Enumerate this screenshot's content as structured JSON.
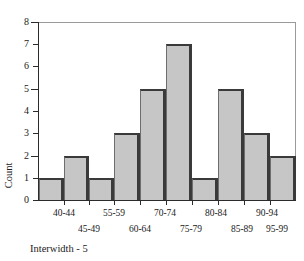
{
  "chart_data": {
    "type": "bar",
    "title": "",
    "xlabel": "Interwidth - 5",
    "ylabel": "Count",
    "ylim": [
      0,
      8
    ],
    "yticks": [
      0,
      1,
      2,
      3,
      4,
      5,
      6,
      7,
      8
    ],
    "grid": false,
    "legend": null,
    "categories": [
      "40-44",
      "45-49",
      "50-54",
      "55-59",
      "60-64",
      "65-69",
      "70-74",
      "75-79",
      "80-84",
      "85-89",
      "90-94",
      "95-99"
    ],
    "values": [
      1,
      2,
      0,
      1,
      3,
      0,
      5,
      7,
      1,
      5,
      3,
      2
    ],
    "bars": [
      {
        "label": "40-44",
        "value": 1
      },
      {
        "label": "45-49",
        "value": 2
      },
      {
        "label": "55-59",
        "value": 1
      },
      {
        "label": "60-64",
        "value": 3
      },
      {
        "label": "70-74",
        "value": 5
      },
      {
        "label": "75-79",
        "value": 7
      },
      {
        "label": "80-84",
        "value": 1
      },
      {
        "label": "85-89",
        "value": 5
      },
      {
        "label": "90-94",
        "value": 3
      },
      {
        "label": "95-99",
        "value": 2
      }
    ],
    "xtick_labels_row1": [
      "40-44",
      "55-59",
      "70-74",
      "80-84",
      "90-94"
    ],
    "xtick_labels_row2": [
      "45-49",
      "60-64",
      "75-79",
      "85-89",
      "95-99"
    ],
    "colors": {
      "bar_fill": "#c6c6c6",
      "bar_edge": "#3a3a3a",
      "axis": "#2b2b2b",
      "frame": "#9a9a9a",
      "text": "#1a1a1a",
      "background": "#ffffff"
    }
  },
  "axis": {
    "y_labels": [
      "8",
      "7",
      "6",
      "5",
      "4",
      "3",
      "2",
      "1",
      "0"
    ],
    "y_title": "Count",
    "x_title": "Interwidth - 5"
  }
}
